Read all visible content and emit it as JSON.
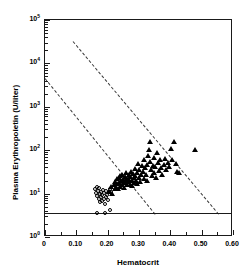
{
  "chart_data": {
    "type": "scatter",
    "title": "",
    "xlabel": "Hematocrit",
    "ylabel": "Plasma Erythropoietin (U/liter)",
    "xlim": [
      0,
      0.6
    ],
    "ylim": [
      1,
      100000
    ],
    "yscale": "log",
    "xscale": "linear",
    "grid": false,
    "legend": "none",
    "xticks": [
      "0",
      "0.10",
      "0.20",
      "0.30",
      "0.40",
      "0.50",
      "0.60"
    ],
    "xtick_values": [
      0,
      0.1,
      0.2,
      0.3,
      0.4,
      0.5,
      0.6
    ],
    "yticks": [
      "10^0",
      "10^1",
      "10^2",
      "10^3",
      "10^4",
      "10^5"
    ],
    "ytick_values": [
      1,
      10,
      100,
      1000,
      10000,
      100000
    ],
    "ytick_mantissa": "10",
    "ytick_exponents": [
      "5",
      "4",
      "3",
      "2",
      "1",
      "0"
    ],
    "series": [
      {
        "name": "open-circles",
        "marker": "open-circle",
        "color": "#000000",
        "points": [
          [
            0.163,
            11.5
          ],
          [
            0.168,
            9.6
          ],
          [
            0.17,
            13.0
          ],
          [
            0.172,
            8.2
          ],
          [
            0.175,
            10.4
          ],
          [
            0.176,
            6.8
          ],
          [
            0.178,
            12.2
          ],
          [
            0.18,
            9.0
          ],
          [
            0.181,
            5.9
          ],
          [
            0.183,
            7.6
          ],
          [
            0.185,
            10.0
          ],
          [
            0.187,
            6.3
          ],
          [
            0.188,
            8.6
          ],
          [
            0.19,
            11.0
          ],
          [
            0.192,
            7.1
          ],
          [
            0.194,
            9.3
          ],
          [
            0.196,
            5.4
          ],
          [
            0.198,
            7.9
          ],
          [
            0.2,
            10.6
          ],
          [
            0.203,
            8.4
          ],
          [
            0.206,
            6.6
          ],
          [
            0.21,
            9.8
          ],
          [
            0.213,
            11.8
          ],
          [
            0.217,
            10.2
          ],
          [
            0.197,
            3.3
          ],
          [
            0.172,
            3.3
          ],
          [
            0.213,
            3.9
          ]
        ]
      },
      {
        "name": "filled-triangles",
        "marker": "filled-triangle",
        "color": "#000000",
        "points": [
          [
            0.208,
            10.6
          ],
          [
            0.214,
            13.4
          ],
          [
            0.218,
            9.4
          ],
          [
            0.222,
            15.0
          ],
          [
            0.225,
            11.8
          ],
          [
            0.228,
            18.0
          ],
          [
            0.23,
            13.0
          ],
          [
            0.232,
            20.5
          ],
          [
            0.234,
            16.0
          ],
          [
            0.236,
            12.2
          ],
          [
            0.238,
            22.0
          ],
          [
            0.24,
            17.0
          ],
          [
            0.242,
            13.8
          ],
          [
            0.244,
            24.0
          ],
          [
            0.246,
            19.0
          ],
          [
            0.248,
            15.2
          ],
          [
            0.25,
            26.0
          ],
          [
            0.252,
            20.0
          ],
          [
            0.254,
            16.4
          ],
          [
            0.256,
            12.8
          ],
          [
            0.258,
            22.5
          ],
          [
            0.26,
            18.2
          ],
          [
            0.262,
            28.0
          ],
          [
            0.264,
            14.6
          ],
          [
            0.266,
            21.0
          ],
          [
            0.268,
            17.4
          ],
          [
            0.27,
            25.0
          ],
          [
            0.272,
            19.6
          ],
          [
            0.274,
            15.0
          ],
          [
            0.276,
            23.0
          ],
          [
            0.278,
            30.0
          ],
          [
            0.28,
            18.8
          ],
          [
            0.282,
            14.2
          ],
          [
            0.284,
            26.5
          ],
          [
            0.286,
            21.5
          ],
          [
            0.288,
            17.0
          ],
          [
            0.29,
            35.0
          ],
          [
            0.292,
            24.0
          ],
          [
            0.294,
            19.0
          ],
          [
            0.296,
            15.5
          ],
          [
            0.298,
            28.0
          ],
          [
            0.3,
            46.0
          ],
          [
            0.302,
            22.0
          ],
          [
            0.304,
            33.0
          ],
          [
            0.306,
            18.0
          ],
          [
            0.31,
            26.0
          ],
          [
            0.313,
            40.0
          ],
          [
            0.316,
            30.0
          ],
          [
            0.318,
            21.0
          ],
          [
            0.32,
            55.0
          ],
          [
            0.322,
            36.0
          ],
          [
            0.325,
            25.0
          ],
          [
            0.328,
            44.0
          ],
          [
            0.33,
            19.0
          ],
          [
            0.333,
            70.0
          ],
          [
            0.335,
            95.0
          ],
          [
            0.337,
            150.0
          ],
          [
            0.339,
            50.0
          ],
          [
            0.341,
            33.0
          ],
          [
            0.344,
            24.0
          ],
          [
            0.347,
            42.0
          ],
          [
            0.35,
            62.0
          ],
          [
            0.352,
            28.0
          ],
          [
            0.355,
            38.0
          ],
          [
            0.358,
            22.0
          ],
          [
            0.36,
            80.0
          ],
          [
            0.363,
            48.0
          ],
          [
            0.366,
            31.0
          ],
          [
            0.37,
            55.0
          ],
          [
            0.374,
            36.0
          ],
          [
            0.378,
            25.0
          ],
          [
            0.382,
            44.0
          ],
          [
            0.386,
            60.0
          ],
          [
            0.39,
            34.0
          ],
          [
            0.395,
            48.0
          ],
          [
            0.4,
            38.0
          ],
          [
            0.405,
            100.0
          ],
          [
            0.41,
            57.0
          ],
          [
            0.415,
            150.0
          ],
          [
            0.42,
            46.0
          ],
          [
            0.425,
            30.0
          ],
          [
            0.432,
            28.0
          ],
          [
            0.483,
            95.0
          ]
        ]
      }
    ],
    "reference_lines": [
      {
        "name": "upper-dashed-line",
        "style": "dashed",
        "x1": 0.092,
        "y1": 31000,
        "x2": 0.556,
        "y2": 3.3
      },
      {
        "name": "lower-dashed-line",
        "style": "dashed",
        "x1": 0.003,
        "y1": 4400,
        "x2": 0.354,
        "y2": 3.3
      },
      {
        "name": "detection-limit-line",
        "style": "solid",
        "x1": 0.0,
        "y1": 3.3,
        "x2": 0.6,
        "y2": 3.3
      }
    ]
  }
}
